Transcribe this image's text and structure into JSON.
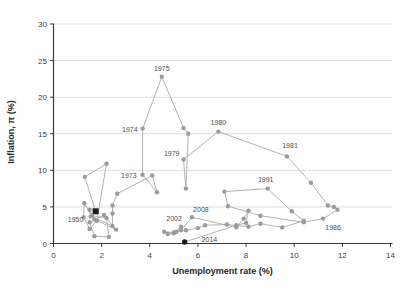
{
  "chart_data": {
    "type": "scatter",
    "title": "",
    "xlabel": "Unemployment rate (%)",
    "ylabel": "Inflation, π (%)",
    "xlim": [
      0,
      14
    ],
    "ylim": [
      0,
      30
    ],
    "xticks": [
      0,
      2,
      4,
      6,
      8,
      10,
      12,
      14
    ],
    "yticks": [
      0,
      5,
      10,
      15,
      20,
      25,
      30
    ],
    "grid": "horizontal",
    "legend": "none",
    "series_name": "Inflation vs unemployment by year, connected chronologically",
    "colors": {
      "line": "#b3b3b3",
      "marker": "#9b9b9b",
      "special": "#1a1a1a",
      "grid": "#dedede",
      "axis": "#3a3a3a",
      "tick_label": "#404040",
      "year_label": "#4d4d4d",
      "background": "#ffffff"
    },
    "points": [
      [
        1950,
        1.75,
        4.4
      ],
      [
        1951,
        1.3,
        9.1
      ],
      [
        1952,
        2.2,
        10.9
      ],
      [
        1953,
        1.8,
        3.1
      ],
      [
        1954,
        1.5,
        2.0
      ],
      [
        1955,
        1.25,
        3.6
      ],
      [
        1956,
        1.28,
        5.5
      ],
      [
        1957,
        1.6,
        3.8
      ],
      [
        1958,
        2.2,
        3.5
      ],
      [
        1959,
        2.3,
        0.9
      ],
      [
        1960,
        1.7,
        1.0
      ],
      [
        1961,
        1.5,
        2.9
      ],
      [
        1962,
        2.1,
        3.9
      ],
      [
        1963,
        2.6,
        1.9
      ],
      [
        1964,
        1.7,
        3.3
      ],
      [
        1965,
        1.5,
        4.6
      ],
      [
        1966,
        1.55,
        3.7
      ],
      [
        1967,
        2.45,
        2.4
      ],
      [
        1968,
        2.45,
        4.1
      ],
      [
        1969,
        2.45,
        5.2
      ],
      [
        1970,
        2.65,
        6.8
      ],
      [
        1971,
        4.1,
        9.3
      ],
      [
        1972,
        4.3,
        7.0
      ],
      [
        1973,
        3.7,
        9.4
      ],
      [
        1974,
        3.7,
        15.7
      ],
      [
        1975,
        4.5,
        22.8
      ],
      [
        1976,
        5.4,
        15.8
      ],
      [
        1977,
        5.6,
        15.0
      ],
      [
        1978,
        5.5,
        7.5
      ],
      [
        1979,
        5.4,
        11.5
      ],
      [
        1980,
        6.85,
        15.3
      ],
      [
        1981,
        9.7,
        11.9
      ],
      [
        1982,
        10.7,
        8.3
      ],
      [
        1983,
        11.4,
        5.2
      ],
      [
        1984,
        11.65,
        5.0
      ],
      [
        1985,
        11.8,
        4.6
      ],
      [
        1986,
        11.2,
        3.4
      ],
      [
        1987,
        10.4,
        2.9
      ],
      [
        1988,
        8.6,
        3.8
      ],
      [
        1989,
        7.25,
        5.1
      ],
      [
        1990,
        7.1,
        7.1
      ],
      [
        1991,
        8.9,
        7.5
      ],
      [
        1992,
        9.9,
        4.4
      ],
      [
        1993,
        10.4,
        3.1
      ],
      [
        1994,
        9.5,
        2.2
      ],
      [
        1995,
        8.6,
        2.7
      ],
      [
        1996,
        8.1,
        2.3
      ],
      [
        1997,
        7.2,
        2.6
      ],
      [
        1998,
        6.3,
        2.5
      ],
      [
        1999,
        6.0,
        2.1
      ],
      [
        2000,
        5.5,
        1.8
      ],
      [
        2001,
        5.1,
        1.6
      ],
      [
        2002,
        5.3,
        2.3
      ],
      [
        2003,
        5.0,
        1.4
      ],
      [
        2004,
        4.75,
        1.3
      ],
      [
        2005,
        4.6,
        1.6
      ],
      [
        2006,
        5.0,
        1.5
      ],
      [
        2007,
        5.3,
        1.8
      ],
      [
        2008,
        5.75,
        3.6
      ],
      [
        2009,
        7.6,
        2.2
      ],
      [
        2010,
        7.9,
        3.4
      ],
      [
        2011,
        8.1,
        4.5
      ],
      [
        2012,
        8.0,
        2.8
      ],
      [
        2013,
        7.6,
        2.5
      ],
      [
        2014,
        5.45,
        0.2
      ]
    ],
    "special_points": [
      {
        "year": 1950,
        "shape": "square"
      },
      {
        "year": 2014,
        "shape": "circle"
      }
    ],
    "annotations": [
      {
        "year": 1950,
        "dx": -20,
        "dy": 11,
        "anchor": "middle"
      },
      {
        "year": 1973,
        "dx": -6,
        "dy": 3,
        "anchor": "end"
      },
      {
        "year": 1974,
        "dx": -5,
        "dy": 3,
        "anchor": "end"
      },
      {
        "year": 1975,
        "dx": 0,
        "dy": -6,
        "anchor": "middle"
      },
      {
        "year": 1979,
        "dx": -4,
        "dy": -3,
        "anchor": "end"
      },
      {
        "year": 1980,
        "dx": 0,
        "dy": -7,
        "anchor": "middle"
      },
      {
        "year": 1981,
        "dx": 3,
        "dy": -8,
        "anchor": "middle"
      },
      {
        "year": 1986,
        "dx": 10,
        "dy": 11,
        "anchor": "middle"
      },
      {
        "year": 1991,
        "dx": -2,
        "dy": -7,
        "anchor": "middle"
      },
      {
        "year": 2002,
        "dx": -7,
        "dy": -6,
        "anchor": "middle"
      },
      {
        "year": 2008,
        "dx": 9,
        "dy": -5,
        "anchor": "middle"
      },
      {
        "year": 2014,
        "dx": 17,
        "dy": 0,
        "anchor": "start"
      }
    ]
  }
}
